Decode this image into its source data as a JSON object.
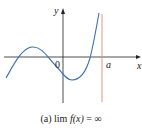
{
  "figure": {
    "axes": {
      "x_label": "x",
      "y_label": "y",
      "origin_label": "0",
      "asymptote_label": "a"
    },
    "colors": {
      "curve": "#3b6fb6",
      "asymptote": "#d98a7a",
      "axes": "#222222"
    },
    "caption": {
      "prefix": "(a)",
      "lim": "lim",
      "func": "f(x)",
      "equals": "=",
      "value": "∞"
    }
  }
}
